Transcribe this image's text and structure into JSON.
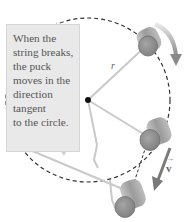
{
  "figure": {
    "callout_text": "When the\nstring breaks,\nthe puck\nmoves in the\ndirection\ntangent\nto the circle.",
    "radius_label": "r",
    "velocity_label": "v",
    "velocity_vector_mark": "→",
    "colors": {
      "circle": "#333333",
      "callout_bg": "#e9e9e9",
      "puck_face": "#8a8a8a",
      "puck_side": "#a8a8a8",
      "string": "#c8c8c8",
      "arrow": "#7a7a7a",
      "center_dot": "#111111"
    }
  }
}
